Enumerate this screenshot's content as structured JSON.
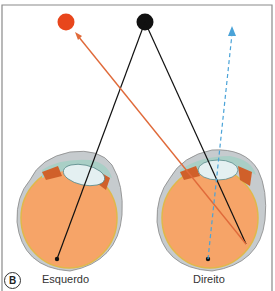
{
  "figure": {
    "panel_label": "B",
    "left_eye_label": "Esquerdo",
    "right_eye_label": "Direito"
  },
  "colors": {
    "red_target": "#e8461c",
    "black_target": "#111111",
    "red_ray": "#e06a3a",
    "blue_ray": "#4aa3d8",
    "vitreous": "#f8a56a",
    "sclera": "#c8cdd0",
    "cornea_chamber": "#a9cfc6",
    "lens": "#dfeef0",
    "iris": "#d2602a",
    "retina_line": "#e8c050",
    "frame": "#888888"
  },
  "elements": {
    "targets": [
      "red-dot",
      "black-dot"
    ],
    "rays": [
      "red-ray-to-right-eye",
      "black-ray-to-left-eye",
      "black-ray-to-right-eye",
      "blue-dashed-projection-arrow"
    ]
  }
}
